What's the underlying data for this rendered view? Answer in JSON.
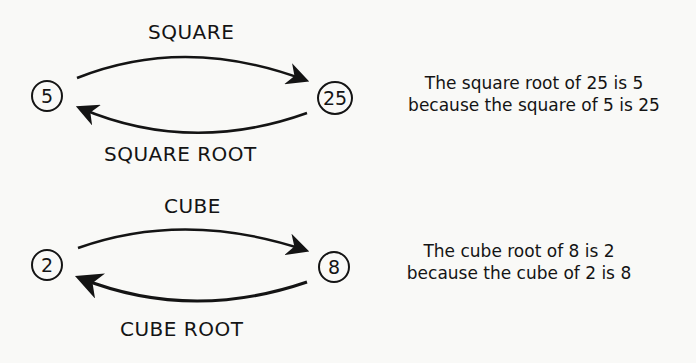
{
  "square_section": {
    "forward_label": "SQUARE",
    "inverse_label": "SQUARE ROOT",
    "left_node": "5",
    "right_node": "25",
    "description_line1": "The square root of 25 is 5",
    "description_line2": "because the square of 5 is 25"
  },
  "cube_section": {
    "forward_label": "CUBE",
    "inverse_label": "CUBE ROOT",
    "left_node": "2",
    "right_node": "8",
    "description_line1": "The cube root of 8 is 2",
    "description_line2": "because the cube of 2 is 8"
  }
}
